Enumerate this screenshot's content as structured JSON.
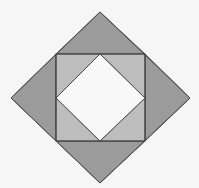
{
  "figure": {
    "width": 199,
    "height": 188,
    "colors": {
      "background": "#f6f6f6",
      "outer_triangle_fill": "#9b9b9b",
      "inner_triangle_fill": "#bdbdbd",
      "center_diamond_fill": "#f8f8f8",
      "stroke": "#474747"
    },
    "outer_diamond": {
      "points": [
        [
          100,
          12
        ],
        [
          190,
          98
        ],
        [
          100,
          183
        ],
        [
          11,
          98
        ]
      ]
    },
    "middle_square": {
      "points": [
        [
          56,
          54
        ],
        [
          145,
          54
        ],
        [
          145,
          141
        ],
        [
          56,
          141
        ]
      ]
    },
    "inner_diamond": {
      "points": [
        [
          100,
          54
        ],
        [
          145,
          98
        ],
        [
          100,
          141
        ],
        [
          56,
          98
        ]
      ]
    },
    "outer_triangles": [
      {
        "name": "top",
        "points": [
          [
            100,
            12
          ],
          [
            145,
            54
          ],
          [
            56,
            54
          ]
        ]
      },
      {
        "name": "right",
        "points": [
          [
            190,
            98
          ],
          [
            145,
            141
          ],
          [
            145,
            54
          ]
        ]
      },
      {
        "name": "bottom",
        "points": [
          [
            100,
            183
          ],
          [
            56,
            141
          ],
          [
            145,
            141
          ]
        ]
      },
      {
        "name": "left",
        "points": [
          [
            11,
            98
          ],
          [
            56,
            54
          ],
          [
            56,
            141
          ]
        ]
      }
    ],
    "inner_triangles": [
      {
        "name": "top-left",
        "points": [
          [
            56,
            54
          ],
          [
            100,
            54
          ],
          [
            56,
            98
          ]
        ]
      },
      {
        "name": "top-right",
        "points": [
          [
            145,
            54
          ],
          [
            145,
            98
          ],
          [
            100,
            54
          ]
        ]
      },
      {
        "name": "bottom-right",
        "points": [
          [
            145,
            141
          ],
          [
            100,
            141
          ],
          [
            145,
            98
          ]
        ]
      },
      {
        "name": "bottom-left",
        "points": [
          [
            56,
            141
          ],
          [
            56,
            98
          ],
          [
            100,
            141
          ]
        ]
      }
    ]
  }
}
